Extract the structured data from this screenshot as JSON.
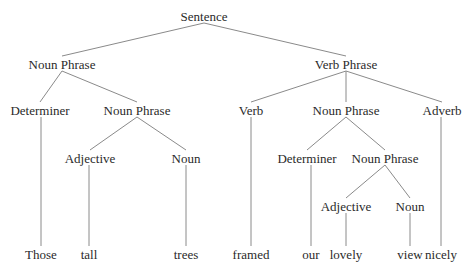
{
  "diagram": {
    "type": "parse-tree",
    "line_color": "#8a8a8a",
    "text_color": "#2a2a2a",
    "nodes": [
      {
        "id": "s",
        "label": "Sentence",
        "x": 204,
        "y": 16,
        "parent": null
      },
      {
        "id": "np1",
        "label": "Noun Phrase",
        "x": 62,
        "y": 64,
        "parent": "s"
      },
      {
        "id": "vp",
        "label": "Verb Phrase",
        "x": 346,
        "y": 64,
        "parent": "s"
      },
      {
        "id": "det1",
        "label": "Determiner",
        "x": 40,
        "y": 110,
        "parent": "np1"
      },
      {
        "id": "np2",
        "label": "Noun Phrase",
        "x": 137,
        "y": 110,
        "parent": "np1"
      },
      {
        "id": "verb",
        "label": "Verb",
        "x": 251,
        "y": 110,
        "parent": "vp"
      },
      {
        "id": "np3",
        "label": "Noun Phrase",
        "x": 346,
        "y": 110,
        "parent": "vp"
      },
      {
        "id": "adv",
        "label": "Adverb",
        "x": 442,
        "y": 110,
        "parent": "vp"
      },
      {
        "id": "adj1",
        "label": "Adjective",
        "x": 90,
        "y": 158,
        "parent": "np2"
      },
      {
        "id": "noun1",
        "label": "Noun",
        "x": 186,
        "y": 158,
        "parent": "np2"
      },
      {
        "id": "det2",
        "label": "Determiner",
        "x": 307,
        "y": 158,
        "parent": "np3"
      },
      {
        "id": "np4",
        "label": "Noun Phrase",
        "x": 385,
        "y": 158,
        "parent": "np3"
      },
      {
        "id": "adj2",
        "label": "Adjective",
        "x": 346,
        "y": 206,
        "parent": "np4"
      },
      {
        "id": "noun2",
        "label": "Noun",
        "x": 410,
        "y": 206,
        "parent": "np4"
      },
      {
        "id": "w1",
        "label": "Those",
        "x": 41,
        "y": 254,
        "parent": "det1"
      },
      {
        "id": "w2",
        "label": "tall",
        "x": 89,
        "y": 254,
        "parent": "adj1"
      },
      {
        "id": "w3",
        "label": "trees",
        "x": 186,
        "y": 254,
        "parent": "noun1"
      },
      {
        "id": "w4",
        "label": "framed",
        "x": 251,
        "y": 254,
        "parent": "verb"
      },
      {
        "id": "w5",
        "label": "our",
        "x": 311,
        "y": 254,
        "parent": "det2"
      },
      {
        "id": "w6",
        "label": "lovely",
        "x": 346,
        "y": 254,
        "parent": "adj2"
      },
      {
        "id": "w7",
        "label": "view",
        "x": 410,
        "y": 254,
        "parent": "noun2"
      },
      {
        "id": "w8",
        "label": "nicely",
        "x": 441,
        "y": 254,
        "parent": "adv"
      }
    ],
    "sentence": "Those tall trees framed our lovely view nicely"
  }
}
